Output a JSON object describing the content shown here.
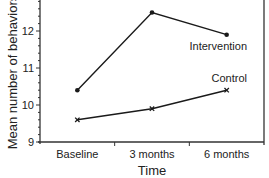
{
  "chart_data": {
    "type": "line",
    "title": "",
    "xlabel": "Time",
    "ylabel": "Mean number of behaviors",
    "categories": [
      "Baseline",
      "3 months",
      "6 months"
    ],
    "series": [
      {
        "name": "Intervention",
        "marker": "dot",
        "values": [
          10.4,
          12.5,
          11.9
        ]
      },
      {
        "name": "Control",
        "marker": "x",
        "values": [
          9.6,
          9.9,
          10.4
        ]
      }
    ],
    "ylim": [
      9,
      13
    ],
    "yticks": [
      9,
      10,
      11,
      12
    ],
    "yminor_step": 0.2,
    "grid": false,
    "legend_position": "inline labels at right end of each line"
  },
  "colors": {
    "line": "#1a1a1a",
    "axis": "#333333",
    "text": "#222222",
    "background": "#ffffff"
  }
}
